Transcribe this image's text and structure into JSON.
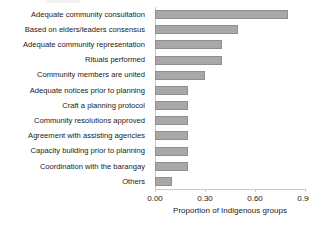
{
  "chart_data": {
    "type": "bar",
    "orientation": "horizontal",
    "title": "",
    "xlabel": "Proportion of Indigenous groups",
    "ylabel": "",
    "xlim": [
      0.0,
      0.9
    ],
    "xticks": [
      "0.00",
      "0.30",
      "0.60",
      "0.90"
    ],
    "xtick_values": [
      0.0,
      0.3,
      0.6,
      0.9
    ],
    "grid": false,
    "legend": null,
    "bar_color": "#a8a8a8",
    "categories": [
      "Adequate community consultation",
      "Based on elders/leaders consensus",
      "Adequate community representation",
      "Rituals performed",
      "Community members are united",
      "Adequate notices prior to planning",
      "Craft a planning protocol",
      "Community resolutions approved",
      "Agreement with assisting agencies",
      "Capacity building prior to planning",
      "Coordination with the barangay",
      "Others"
    ],
    "values": [
      0.8,
      0.5,
      0.4,
      0.4,
      0.3,
      0.2,
      0.2,
      0.2,
      0.2,
      0.2,
      0.2,
      0.1
    ]
  }
}
